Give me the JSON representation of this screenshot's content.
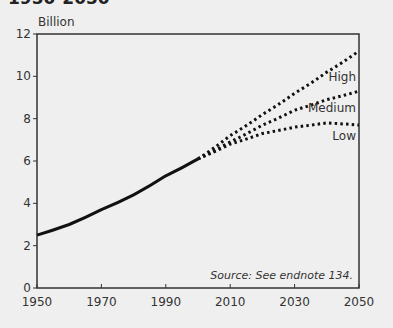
{
  "title": "1950-2050",
  "chart_data": {
    "type": "line",
    "title": "1950-2050",
    "ylabel": "Billion",
    "xlabel": "",
    "xlim": [
      1950,
      2050
    ],
    "ylim": [
      0,
      12
    ],
    "x_ticks": [
      "1950",
      "1970",
      "1990",
      "2010",
      "2030",
      "2050"
    ],
    "y_ticks": [
      "0",
      "2",
      "4",
      "6",
      "8",
      "10",
      "12"
    ],
    "grid": false,
    "annotation": "Source: See endnote 134.",
    "series": [
      {
        "name": "Historical",
        "style": "solid",
        "x": [
          1950,
          1960,
          1970,
          1980,
          1990,
          2000
        ],
        "values": [
          2.5,
          3.0,
          3.7,
          4.4,
          5.3,
          6.1
        ]
      },
      {
        "name": "High",
        "style": "dotted",
        "x": [
          2000,
          2010,
          2020,
          2030,
          2040,
          2050
        ],
        "values": [
          6.1,
          7.2,
          8.2,
          9.2,
          10.2,
          11.2
        ]
      },
      {
        "name": "Medium",
        "style": "dotted",
        "x": [
          2000,
          2010,
          2020,
          2030,
          2040,
          2050
        ],
        "values": [
          6.1,
          6.9,
          7.7,
          8.4,
          8.9,
          9.3
        ]
      },
      {
        "name": "Low",
        "style": "dotted",
        "x": [
          2000,
          2010,
          2020,
          2030,
          2040,
          2050
        ],
        "values": [
          6.1,
          6.8,
          7.3,
          7.6,
          7.8,
          7.7
        ]
      }
    ]
  }
}
